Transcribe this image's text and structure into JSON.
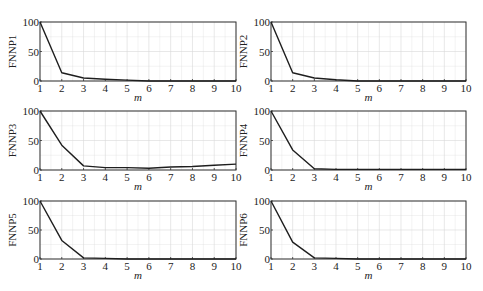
{
  "chart_data": [
    {
      "type": "line",
      "title": "",
      "xlabel": "m",
      "ylabel": "FNNP1",
      "x": [
        1,
        2,
        3,
        4,
        5,
        6,
        7,
        8,
        9,
        10
      ],
      "series": [
        {
          "name": "FNNP1",
          "values": [
            100,
            14,
            5,
            3,
            1.5,
            0,
            0,
            0,
            0,
            0
          ]
        }
      ],
      "xlim": [
        1,
        10
      ],
      "ylim": [
        0,
        100
      ],
      "yticks": [
        0,
        50,
        100
      ],
      "xticks": [
        1,
        2,
        3,
        4,
        5,
        6,
        7,
        8,
        9,
        10
      ],
      "grid": true
    },
    {
      "type": "line",
      "title": "",
      "xlabel": "m",
      "ylabel": "FNNP2",
      "x": [
        1,
        2,
        3,
        4,
        5,
        6,
        7,
        8,
        9,
        10
      ],
      "series": [
        {
          "name": "FNNP2",
          "values": [
            100,
            14,
            5,
            2,
            0,
            0,
            0,
            0,
            0,
            0
          ]
        }
      ],
      "xlim": [
        1,
        10
      ],
      "ylim": [
        0,
        100
      ],
      "yticks": [
        0,
        50,
        100
      ],
      "xticks": [
        1,
        2,
        3,
        4,
        5,
        6,
        7,
        8,
        9,
        10
      ],
      "grid": true
    },
    {
      "type": "line",
      "title": "",
      "xlabel": "m",
      "ylabel": "FNNP3",
      "x": [
        1,
        2,
        3,
        4,
        5,
        6,
        7,
        8,
        9,
        10
      ],
      "series": [
        {
          "name": "FNNP3",
          "values": [
            100,
            42,
            7,
            4,
            4,
            3,
            5,
            6,
            8,
            10
          ]
        }
      ],
      "xlim": [
        1,
        10
      ],
      "ylim": [
        0,
        100
      ],
      "yticks": [
        0,
        50,
        100
      ],
      "xticks": [
        1,
        2,
        3,
        4,
        5,
        6,
        7,
        8,
        9,
        10
      ],
      "grid": true
    },
    {
      "type": "line",
      "title": "",
      "xlabel": "m",
      "ylabel": "FNNP4",
      "x": [
        1,
        2,
        3,
        4,
        5,
        6,
        7,
        8,
        9,
        10
      ],
      "series": [
        {
          "name": "FNNP4",
          "values": [
            100,
            34,
            2,
            1,
            1,
            1,
            1,
            1,
            1,
            1
          ]
        }
      ],
      "xlim": [
        1,
        10
      ],
      "ylim": [
        0,
        100
      ],
      "yticks": [
        0,
        50,
        100
      ],
      "xticks": [
        1,
        2,
        3,
        4,
        5,
        6,
        7,
        8,
        9,
        10
      ],
      "grid": true
    },
    {
      "type": "line",
      "title": "",
      "xlabel": "m",
      "ylabel": "FNNP5",
      "x": [
        1,
        2,
        3,
        4,
        5,
        6,
        7,
        8,
        9,
        10
      ],
      "series": [
        {
          "name": "FNNP5",
          "values": [
            100,
            32,
            2,
            1,
            0,
            0,
            0,
            0,
            0,
            0
          ]
        }
      ],
      "xlim": [
        1,
        10
      ],
      "ylim": [
        0,
        100
      ],
      "yticks": [
        0,
        50,
        100
      ],
      "xticks": [
        1,
        2,
        3,
        4,
        5,
        6,
        7,
        8,
        9,
        10
      ],
      "grid": true
    },
    {
      "type": "line",
      "title": "",
      "xlabel": "m",
      "ylabel": "FNNP6",
      "x": [
        1,
        2,
        3,
        4,
        5,
        6,
        7,
        8,
        9,
        10
      ],
      "series": [
        {
          "name": "FNNP6",
          "values": [
            100,
            29,
            2,
            1,
            0,
            0,
            0,
            0,
            0,
            0
          ]
        }
      ],
      "xlim": [
        1,
        10
      ],
      "ylim": [
        0,
        100
      ],
      "yticks": [
        0,
        50,
        100
      ],
      "xticks": [
        1,
        2,
        3,
        4,
        5,
        6,
        7,
        8,
        9,
        10
      ],
      "grid": true
    }
  ],
  "layout": {
    "panels": [
      {
        "left": 40,
        "top": 22,
        "width": 196,
        "height": 59
      },
      {
        "left": 271,
        "top": 22,
        "width": 195,
        "height": 59
      },
      {
        "left": 40,
        "top": 111,
        "width": 196,
        "height": 59
      },
      {
        "left": 271,
        "top": 111,
        "width": 195,
        "height": 59
      },
      {
        "left": 40,
        "top": 201,
        "width": 196,
        "height": 58
      },
      {
        "left": 271,
        "top": 201,
        "width": 195,
        "height": 58
      }
    ]
  },
  "colors": {
    "line": "#1e1e1e",
    "frame": "#333333",
    "grid": "#d9d9d9"
  }
}
